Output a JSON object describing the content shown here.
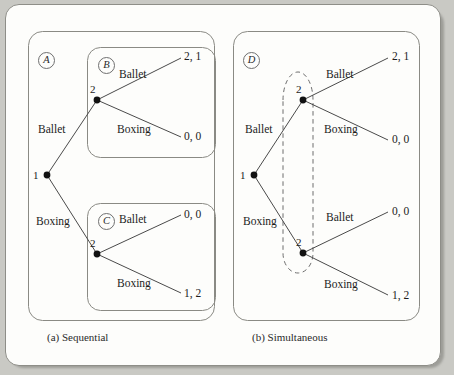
{
  "figure": {
    "type": "game-tree-diagram",
    "background_color": "#c9c9c4",
    "page_color": "#fdfdfb",
    "ink_color": "#1c1c1c"
  },
  "panels": [
    {
      "id": "sequential",
      "caption": "(a) Sequential",
      "information_sets": [
        "A",
        "B",
        "C"
      ],
      "root": {
        "player": "1",
        "label": "1"
      },
      "player1_branches": [
        "Ballet",
        "Boxing"
      ],
      "player2_nodes": [
        {
          "label": "2",
          "set": "B",
          "branches": [
            {
              "action": "Ballet",
              "payoff": "2, 1"
            },
            {
              "action": "Boxing",
              "payoff": "0, 0"
            }
          ]
        },
        {
          "label": "2",
          "set": "C",
          "branches": [
            {
              "action": "Ballet",
              "payoff": "0, 0"
            },
            {
              "action": "Boxing",
              "payoff": "1, 2"
            }
          ]
        }
      ]
    },
    {
      "id": "simultaneous",
      "caption": "(b) Simultaneous",
      "information_sets": [
        "D"
      ],
      "root": {
        "player": "1",
        "label": "1"
      },
      "player1_branches": [
        "Ballet",
        "Boxing"
      ],
      "player2_nodes": [
        {
          "label": "2",
          "branches": [
            {
              "action": "Ballet",
              "payoff": "2, 1"
            },
            {
              "action": "Boxing",
              "payoff": "0, 0"
            }
          ]
        },
        {
          "label": "2",
          "branches": [
            {
              "action": "Ballet",
              "payoff": "0, 0"
            },
            {
              "action": "Boxing",
              "payoff": "1, 2"
            }
          ]
        }
      ],
      "dashed_info_set_oval": true
    }
  ]
}
